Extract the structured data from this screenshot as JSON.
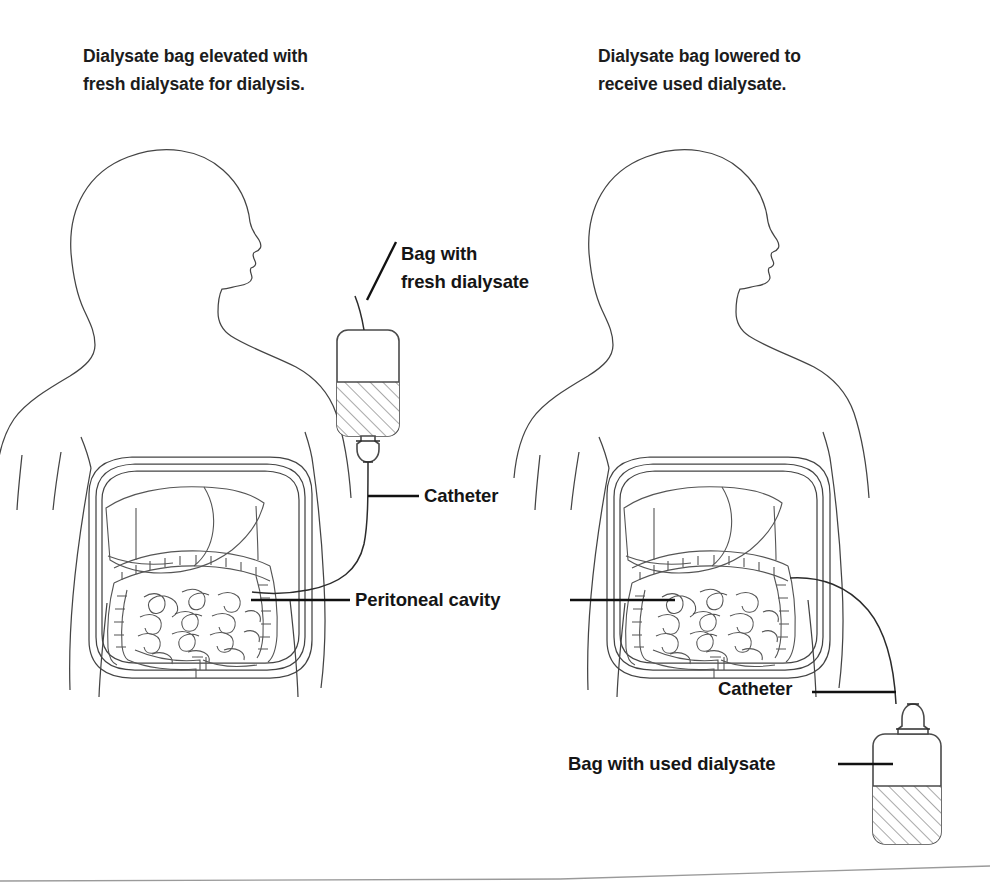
{
  "figure": {
    "kind": "medical-illustration",
    "panels": [
      {
        "id": "left",
        "title": "Dialysate bag elevated with\nfresh dialysate for dialysis.",
        "bag_state": "elevated",
        "bag_contents": "fresh dialysate",
        "fill_level_percent": 55
      },
      {
        "id": "right",
        "title": "Dialysate bag lowered to\nreceive used dialysate.",
        "bag_state": "lowered",
        "bag_contents": "used dialysate",
        "fill_level_percent": 52
      }
    ]
  },
  "labels": {
    "fresh_bag": "Bag with\nfresh dialysate",
    "catheter_left": "Catheter",
    "peritoneal_cavity": "Peritoneal cavity",
    "catheter_right": "Catheter",
    "used_bag": "Bag with used dialysate"
  },
  "colors": {
    "background": "#ffffff",
    "ink": "#1a1a1a",
    "outline": "#444444",
    "leader": "#111111",
    "hatch": "#8d8d8d",
    "page_edge": "#9a9a9a"
  }
}
